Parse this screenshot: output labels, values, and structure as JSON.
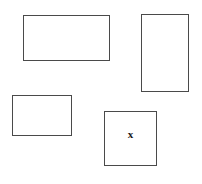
{
  "figure": {
    "width": 202,
    "height": 184,
    "background_color": "#ffffff",
    "stroke_color": "#4a4a4a",
    "stroke_width": 1,
    "label_color": "#1a1a1a"
  },
  "shapes": [
    {
      "id": "rect-top-left",
      "name": "top-left-rectangle",
      "x": 23,
      "y": 15,
      "width": 87,
      "height": 46,
      "label": ""
    },
    {
      "id": "rect-top-right",
      "name": "top-right-rectangle",
      "x": 141,
      "y": 14,
      "width": 48,
      "height": 78,
      "label": ""
    },
    {
      "id": "rect-bottom-left",
      "name": "bottom-left-rectangle",
      "x": 12,
      "y": 95,
      "width": 60,
      "height": 41,
      "label": ""
    },
    {
      "id": "rect-bottom-right",
      "name": "bottom-right-square",
      "x": 104,
      "y": 111,
      "width": 53,
      "height": 55,
      "label": "x"
    }
  ],
  "labels": {
    "x_mark": "x",
    "x_mark_font_size": 11
  }
}
